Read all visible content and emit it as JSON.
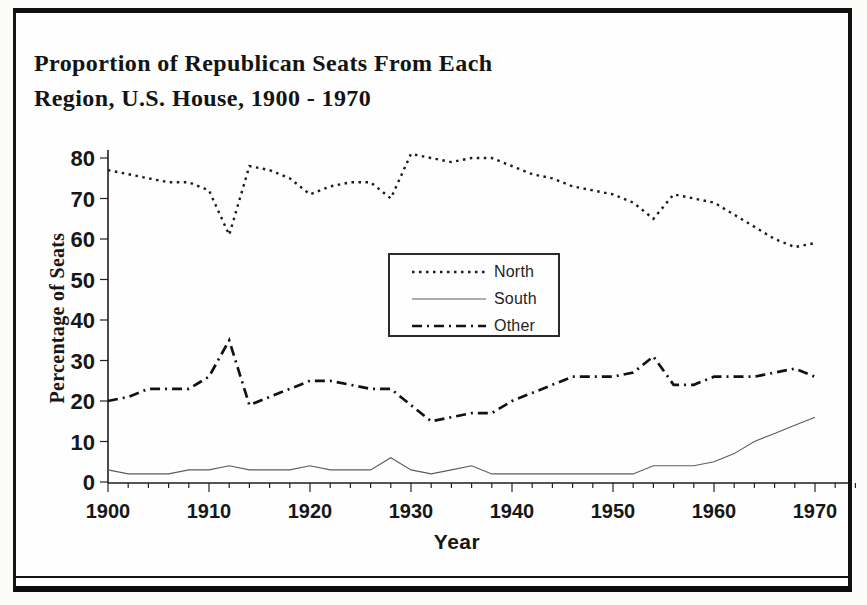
{
  "page": {
    "title_line1": "Proportion of Republican Seats From Each",
    "title_line2": "Region, U.S. House, 1900 - 1970"
  },
  "chart_data": {
    "type": "line",
    "title": "Proportion of Republican Seats From Each Region, U.S. House, 1900 - 1970",
    "xlabel": "Year",
    "ylabel": "Percentage of Seats",
    "xlim": [
      1900,
      1974
    ],
    "ylim": [
      0,
      80
    ],
    "grid": false,
    "legend_position": "upper-center-inside",
    "x_tick_labels": [
      "1900",
      "1910",
      "1920",
      "1930",
      "1940",
      "1950",
      "1960",
      "1970"
    ],
    "x_minor_tick_step_years": 2,
    "y_ticks": [
      0,
      10,
      20,
      30,
      40,
      50,
      60,
      70,
      80
    ],
    "x": [
      1900,
      1902,
      1904,
      1906,
      1908,
      1910,
      1912,
      1914,
      1916,
      1918,
      1920,
      1922,
      1924,
      1926,
      1928,
      1930,
      1932,
      1934,
      1936,
      1938,
      1940,
      1942,
      1944,
      1946,
      1948,
      1950,
      1952,
      1954,
      1956,
      1958,
      1960,
      1962,
      1964,
      1966,
      1968,
      1970
    ],
    "series": [
      {
        "name": "North",
        "line_style": "dotted",
        "color": "#1a1a1a",
        "values": [
          77,
          76,
          75,
          74,
          74,
          72,
          61,
          78,
          77,
          75,
          71,
          73,
          74,
          74,
          70,
          81,
          80,
          79,
          80,
          80,
          78,
          76,
          75,
          73,
          72,
          71,
          69,
          65,
          71,
          70,
          69,
          66,
          63,
          60,
          58,
          59
        ]
      },
      {
        "name": "South",
        "line_style": "solid-thin",
        "color": "#5d5d5d",
        "values": [
          3,
          2,
          2,
          2,
          3,
          3,
          4,
          3,
          3,
          3,
          4,
          3,
          3,
          3,
          6,
          3,
          2,
          3,
          4,
          2,
          2,
          2,
          2,
          2,
          2,
          2,
          2,
          4,
          4,
          4,
          5,
          7,
          10,
          12,
          14,
          16
        ]
      },
      {
        "name": "Other",
        "line_style": "dash-dot",
        "color": "#121212",
        "values": [
          20,
          21,
          23,
          23,
          23,
          26,
          35,
          19,
          21,
          23,
          25,
          25,
          24,
          23,
          23,
          19,
          15,
          16,
          17,
          17,
          20,
          22,
          24,
          26,
          26,
          26,
          27,
          31,
          24,
          24,
          26,
          26,
          26,
          27,
          28,
          26
        ]
      }
    ]
  }
}
